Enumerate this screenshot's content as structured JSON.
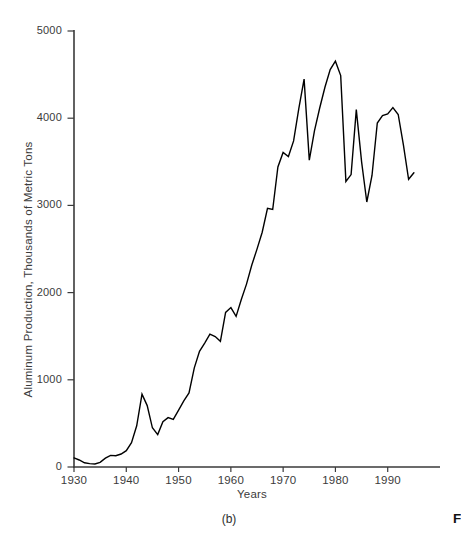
{
  "figure": {
    "panel_label": "(b)",
    "caption_fragment": "F"
  },
  "chart_data": {
    "type": "line",
    "title": "",
    "xlabel": "Years",
    "ylabel": "Aluminum Production, Thousands of Metric Tons",
    "xlim": [
      1930,
      2000
    ],
    "ylim": [
      0,
      5000
    ],
    "x_ticks": [
      1930,
      1940,
      1950,
      1960,
      1970,
      1980,
      1990
    ],
    "y_ticks": [
      0,
      1000,
      2000,
      3000,
      4000,
      5000
    ],
    "grid": false,
    "legend": false,
    "line_color": "#000000",
    "axis_color": "#3a3a3a",
    "label_color": "#3b3b3b",
    "x": [
      1930,
      1931,
      1932,
      1933,
      1934,
      1935,
      1936,
      1937,
      1938,
      1939,
      1940,
      1941,
      1942,
      1943,
      1944,
      1945,
      1946,
      1947,
      1948,
      1949,
      1950,
      1951,
      1952,
      1953,
      1954,
      1955,
      1956,
      1957,
      1958,
      1959,
      1960,
      1961,
      1962,
      1963,
      1964,
      1965,
      1966,
      1967,
      1968,
      1969,
      1970,
      1971,
      1972,
      1973,
      1974,
      1975,
      1976,
      1977,
      1978,
      1979,
      1980,
      1981,
      1982,
      1983,
      1984,
      1985,
      1986,
      1987,
      1988,
      1989,
      1990,
      1991,
      1992,
      1993,
      1994,
      1995
    ],
    "y": [
      104,
      80,
      48,
      39,
      34,
      54,
      102,
      133,
      130,
      149,
      187,
      280,
      473,
      835,
      704,
      449,
      372,
      519,
      566,
      547,
      652,
      759,
      850,
      1136,
      1326,
      1421,
      1523,
      1495,
      1442,
      1773,
      1828,
      1727,
      1921,
      2098,
      2316,
      2499,
      2693,
      2966,
      2953,
      3441,
      3607,
      3561,
      3740,
      4109,
      4448,
      3519,
      3857,
      4117,
      4358,
      4557,
      4654,
      4489,
      3274,
      3353,
      4099,
      3500,
      3039,
      3343,
      3945,
      4030,
      4048,
      4121,
      4042,
      3695,
      3299,
      3375
    ]
  }
}
